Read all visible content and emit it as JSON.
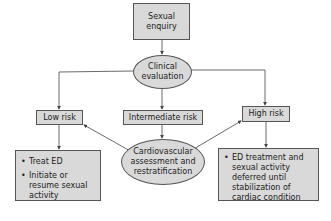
{
  "nodes": {
    "start": "Sexual enquiry",
    "evaluation": "Clinical evaluation",
    "low": "Low risk",
    "intermediate": "Intermediate risk",
    "high": "High risk",
    "reassess": "Cardiovascular assessment and restratification"
  },
  "outcomes": {
    "low": [
      "Treat ED",
      "Initiate or resume sexual activity"
    ],
    "high": [
      "ED treatment and sexual activity deferred until stabilization of cardiac condition"
    ]
  },
  "colors": {
    "fill": "#d9d9d9",
    "stroke": "#555555",
    "line": "#444444"
  }
}
